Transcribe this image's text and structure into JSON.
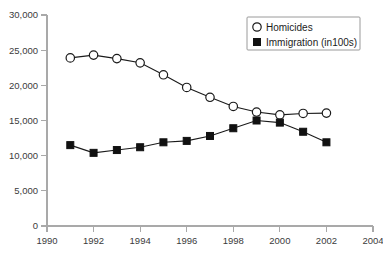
{
  "chart_data": {
    "type": "line",
    "title": "",
    "subtitle": "",
    "xlabel": "",
    "ylabel": "",
    "x": [
      1991,
      1992,
      1993,
      1994,
      1995,
      1996,
      1997,
      1998,
      1999,
      2000,
      2001,
      2002
    ],
    "series": [
      {
        "name": "Homicides",
        "marker": "open-circle",
        "values": [
          23900,
          24300,
          23800,
          23200,
          21500,
          19700,
          18300,
          17000,
          16200,
          15800,
          16000,
          16050
        ]
      },
      {
        "name": "Immigration (in100s)",
        "marker": "filled-square",
        "values": [
          11500,
          10400,
          10800,
          11200,
          11900,
          12100,
          12800,
          13900,
          15000,
          14700,
          13400,
          11900
        ]
      }
    ],
    "xlim": [
      1990,
      2004
    ],
    "ylim": [
      0,
      30000
    ],
    "xticks": [
      1990,
      1992,
      1994,
      1996,
      1998,
      2000,
      2002,
      2004
    ],
    "xtick_labels": [
      "1990",
      "1992",
      "1994",
      "1996",
      "1998",
      "2000",
      "2002",
      "2004"
    ],
    "yticks": [
      0,
      5000,
      10000,
      15000,
      20000,
      25000,
      30000
    ],
    "ytick_labels": [
      "0",
      "5,000",
      "10,000",
      "15,000",
      "20,000",
      "25,000",
      "30,000"
    ],
    "grid": false,
    "legend_position": "top-right",
    "colors": {
      "line": "#1a1a1a",
      "axis": "#a9a9a9",
      "text": "#3b3b3b",
      "background": "#ffffff"
    }
  },
  "legend": {
    "entries": [
      {
        "label": "Homicides",
        "marker": "open-circle-marker"
      },
      {
        "label": "Immigration (in100s)",
        "marker": "filled-square-marker"
      }
    ]
  }
}
